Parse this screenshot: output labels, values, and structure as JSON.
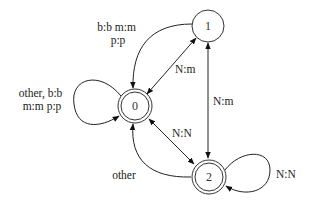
{
  "diagram": {
    "type": "finite-state-transducer",
    "nodes": [
      {
        "id": "0",
        "label": "0",
        "accepting": true,
        "cx": 135,
        "cy": 106
      },
      {
        "id": "1",
        "label": "1",
        "accepting": false,
        "cx": 208,
        "cy": 26
      },
      {
        "id": "2",
        "label": "2",
        "accepting": true,
        "cx": 209,
        "cy": 177
      }
    ],
    "edges": [
      {
        "from": "0",
        "to": "0",
        "label_line1": "other, b:b",
        "label_line2": "m:m p:p",
        "kind": "self-loop"
      },
      {
        "from": "1",
        "to": "0",
        "label_line1": "b:b m:m",
        "label_line2": "p:p",
        "kind": "curved"
      },
      {
        "from": "0",
        "to": "1",
        "label": "N:m",
        "kind": "bidirectional"
      },
      {
        "from": "1",
        "to": "2",
        "label": "N:m",
        "kind": "bidirectional"
      },
      {
        "from": "0",
        "to": "2",
        "label": "N:N",
        "kind": "bidirectional"
      },
      {
        "from": "2",
        "to": "0",
        "label": "other",
        "kind": "curved"
      },
      {
        "from": "2",
        "to": "2",
        "label": "N:N",
        "kind": "self-loop"
      }
    ]
  }
}
